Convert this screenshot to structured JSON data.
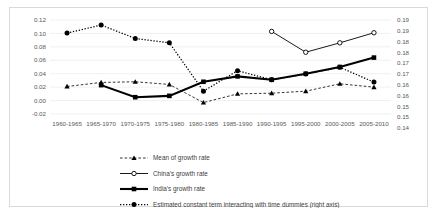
{
  "chart_data": {
    "type": "line",
    "title": "",
    "xlabel": "",
    "ylabel": "",
    "categories": [
      "1960-1965",
      "1965-1970",
      "1970-1975",
      "1975-1980",
      "1980-1985",
      "1985-1990",
      "1990-1995",
      "1995-2000",
      "2000-2005",
      "2005-2010"
    ],
    "left_axis": {
      "ticks": [
        "0.12",
        "0.10",
        "0.08",
        "0.06",
        "0.04",
        "0.02",
        "0.00",
        "-0.02"
      ],
      "values": [
        0.12,
        0.1,
        0.08,
        0.06,
        0.04,
        0.02,
        0.0,
        -0.02
      ],
      "ylim": [
        -0.02,
        0.12
      ]
    },
    "right_axis": {
      "ticks": [
        "0.19",
        "0.19",
        "0.18",
        "0.18",
        "0.17",
        "0.17",
        "0.16",
        "0.16",
        "0.15",
        "0.15",
        "0.14"
      ],
      "values": [
        0.195,
        0.19,
        0.185,
        0.18,
        0.175,
        0.17,
        0.165,
        0.16,
        0.155,
        0.15,
        0.145
      ],
      "ylim": [
        0.145,
        0.195
      ]
    },
    "grid": true,
    "legend_position": "bottom",
    "series": [
      {
        "name": "Mean of growth rate",
        "axis": "left",
        "marker": "triangle",
        "line_style": "dashed",
        "values": [
          0.021,
          0.027,
          0.028,
          0.024,
          -0.003,
          0.01,
          0.011,
          0.014,
          0.025,
          0.02
        ]
      },
      {
        "name": "China's growth rate",
        "axis": "left",
        "marker": "open-circle",
        "line_style": "solid",
        "values": [
          null,
          null,
          null,
          null,
          null,
          null,
          0.103,
          0.072,
          0.086,
          0.101
        ]
      },
      {
        "name": "India's growth rate",
        "axis": "left",
        "marker": "square",
        "line_style": "solid-thick",
        "values": [
          null,
          0.023,
          0.005,
          0.007,
          0.028,
          0.036,
          0.031,
          0.04,
          0.05,
          0.064
        ]
      },
      {
        "name": "Estimated constant term interacting with time dummies (right axis)",
        "axis": "right",
        "marker": "circle",
        "line_style": "dotted",
        "values": [
          0.1005,
          0.1125,
          0.0925,
          0.086,
          0.014,
          0.0445,
          0.031,
          0.0395,
          0.0495,
          0.0275
        ],
        "values_right_scale": [
          0.186,
          0.1903,
          0.1795,
          0.1765,
          0.15,
          0.1609,
          0.1561,
          0.1591,
          0.1627,
          0.1548
        ]
      }
    ]
  },
  "legend": {
    "items": [
      {
        "label": "Mean of growth rate"
      },
      {
        "label": "China's growth rate"
      },
      {
        "label": "India's growth rate"
      },
      {
        "label": "Estimated constant term interacting with time dummies (right axis)"
      }
    ]
  },
  "colors": {
    "series": "#000000",
    "grid": "#e6e6e6",
    "text": "#595959",
    "border": "#d9d9d9",
    "background": "#ffffff"
  }
}
